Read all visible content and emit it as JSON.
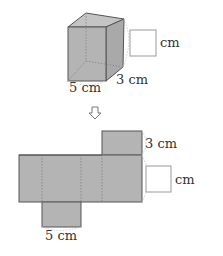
{
  "figure": {
    "cube": {
      "dim_front_label": "5 cm",
      "dim_depth_label": "3 cm",
      "height_unit_label": "cm",
      "height_answer_box": ""
    },
    "arrow": {
      "icon": "down-arrow-icon",
      "glyph": "⇩"
    },
    "net": {
      "top_flap_label": "3 cm",
      "bottom_flap_label": "5 cm",
      "height_unit_label": "cm",
      "height_answer_box": ""
    },
    "colors": {
      "face_fill": "#b3b3b3",
      "face_top": "#c6c6c6",
      "face_right": "#a8a8a8",
      "edge": "#555555",
      "dashed": "#888888",
      "dotted_guide": "#cccccc",
      "box_border": "#999999"
    }
  }
}
